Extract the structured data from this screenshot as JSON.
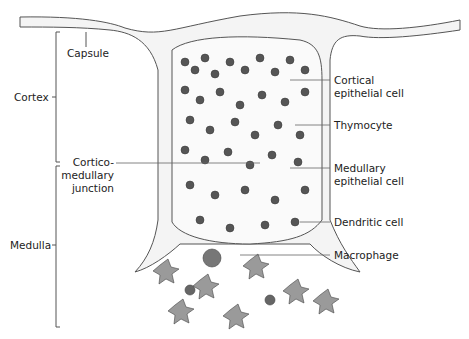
{
  "diagram": {
    "regions": {
      "capsule": "Capsule",
      "cortex": "Cortex",
      "medulla": "Medulla",
      "junction_line1": "Cortico-",
      "junction_line2": "medullary",
      "junction_line3": "junction"
    },
    "cell_labels": {
      "cortical_line1": "Cortical",
      "cortical_line2": "epithelial cell",
      "thymocyte": "Thymocyte",
      "medullary_line1": "Medullary",
      "medullary_line2": "epithelial cell",
      "dendritic": "Dendritic cell",
      "macrophage": "Macrophage"
    },
    "colors": {
      "thymocyte": "#555555",
      "capsule_fill": "#f2f2f2",
      "medulla_cell": "#9a9a9a",
      "line": "#444444"
    }
  }
}
